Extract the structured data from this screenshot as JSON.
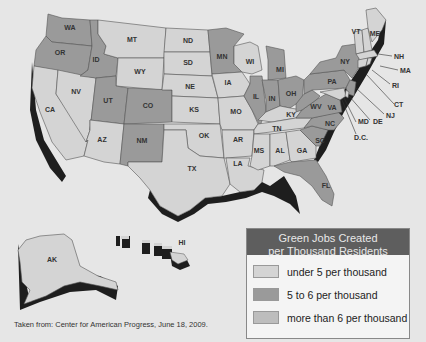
{
  "legend": {
    "title_line1": "Green Jobs Created",
    "title_line2": "per Thousand Residents",
    "items": [
      {
        "label": "under 5 per thousand",
        "color": "#d4d4d4"
      },
      {
        "label": "5 to 6 per thousand",
        "color": "#9a9a9a"
      },
      {
        "label": "more than 6 per thousand",
        "color": "#bdbdbd"
      }
    ],
    "header_color": "#5e5e5e"
  },
  "source": "Taken from: Center for American Progress, June 18, 2009.",
  "colors": {
    "background": "#e6e6e6",
    "under_5": "#d4d4d4",
    "five_to_6": "#9a9a9a",
    "over_6": "#bdbdbd",
    "shadow": "#1e1e1e"
  },
  "states": {
    "WA": "WA",
    "OR": "OR",
    "CA": "CA",
    "NV": "NV",
    "ID": "ID",
    "MT": "MT",
    "WY": "WY",
    "UT": "UT",
    "AZ": "AZ",
    "CO": "CO",
    "NM": "NM",
    "ND": "ND",
    "SD": "SD",
    "NE": "NE",
    "KS": "KS",
    "OK": "OK",
    "TX": "TX",
    "MN": "MN",
    "IA": "IA",
    "MO": "MO",
    "AR": "AR",
    "LA": "LA",
    "WI": "WI",
    "IL": "IL",
    "MI": "MI",
    "IN": "IN",
    "OH": "OH",
    "KY": "KY",
    "TN": "TN",
    "MS": "MS",
    "AL": "AL",
    "GA": "GA",
    "FL": "FL",
    "SC": "SC",
    "NC": "NC",
    "VA": "VA",
    "WV": "WV",
    "PA": "PA",
    "NY": "NY",
    "VT": "VT",
    "ME": "ME",
    "NH": "NH",
    "MA": "MA",
    "RI": "RI",
    "CT": "CT",
    "NJ": "NJ",
    "DE": "DE",
    "MD": "MD",
    "DC": "D.C.",
    "AK": "AK",
    "HI": "HI"
  }
}
